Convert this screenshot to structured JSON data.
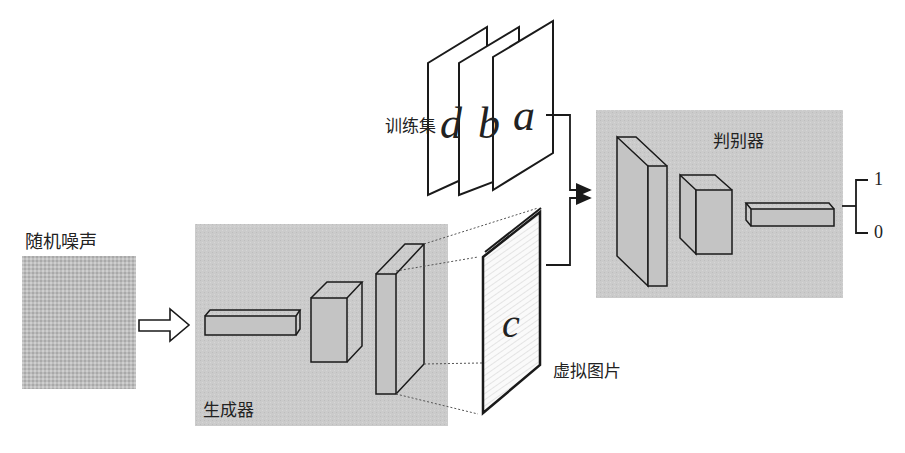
{
  "noise": {
    "label": "随机噪声"
  },
  "generator": {
    "label": "生成器"
  },
  "training_set": {
    "label": "训练集",
    "pages": [
      "d",
      "b",
      "a"
    ]
  },
  "fake_image": {
    "label": "虚拟图片",
    "letter": "c"
  },
  "discriminator": {
    "label": "判别器"
  },
  "outputs": {
    "real": "1",
    "fake": "0"
  },
  "colors": {
    "panel": "#c8c8c8",
    "noise": "#b9b9b9",
    "stroke": "#1a1a1a"
  }
}
